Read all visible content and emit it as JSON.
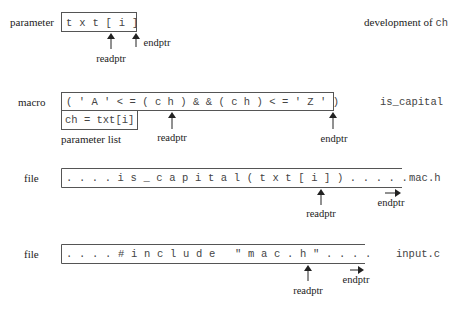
{
  "rows": [
    {
      "kind_label": "parameter",
      "content": "t x t [ i ]",
      "side_label_text": "development of ",
      "side_label_code": "ch",
      "readptr_label": "readptr",
      "endptr_label": "endptr"
    },
    {
      "kind_label": "macro",
      "content": "( ' A ' < = ( c h ) & & ( c h ) < = ' Z ' )",
      "sub_box": "ch = txt[i]",
      "sub_box_caption": "parameter list",
      "side_label_code": "is_capital",
      "readptr_label": "readptr",
      "endptr_label": "endptr"
    },
    {
      "kind_label": "file",
      "content": ". . . . i s _ c a p i t a l ( t x t [ i ] ) . . . . .",
      "side_label_code": "mac.h",
      "readptr_label": "readptr",
      "endptr_label": "endptr"
    },
    {
      "kind_label": "file",
      "content": ". . . . # i n c l u d e   \" m a c . h \" . . . .",
      "side_label_code": "input.c",
      "readptr_label": "readptr",
      "endptr_label": "endptr"
    }
  ]
}
